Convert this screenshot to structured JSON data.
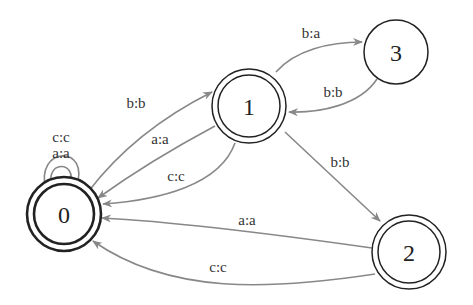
{
  "diagram": {
    "type": "finite-state-transducer",
    "nodes": [
      {
        "id": "0",
        "label": "0",
        "final": true,
        "initial_emphasis": true
      },
      {
        "id": "1",
        "label": "1",
        "final": true
      },
      {
        "id": "2",
        "label": "2",
        "final": true
      },
      {
        "id": "3",
        "label": "3",
        "final": false
      }
    ],
    "edges": [
      {
        "from": "0",
        "to": "0",
        "label": "a:a"
      },
      {
        "from": "0",
        "to": "0",
        "label": "c:c"
      },
      {
        "from": "0",
        "to": "1",
        "label": "b:b"
      },
      {
        "from": "1",
        "to": "0",
        "label": "a:a"
      },
      {
        "from": "1",
        "to": "0",
        "label": "c:c"
      },
      {
        "from": "1",
        "to": "3",
        "label": "b:a"
      },
      {
        "from": "3",
        "to": "1",
        "label": "b:b"
      },
      {
        "from": "1",
        "to": "2",
        "label": "b:b"
      },
      {
        "from": "2",
        "to": "0",
        "label": "a:a"
      },
      {
        "from": "2",
        "to": "0",
        "label": "c:c"
      }
    ],
    "colors": {
      "edge": "#888888",
      "node_stroke": "#222222",
      "text": "#333333"
    }
  }
}
